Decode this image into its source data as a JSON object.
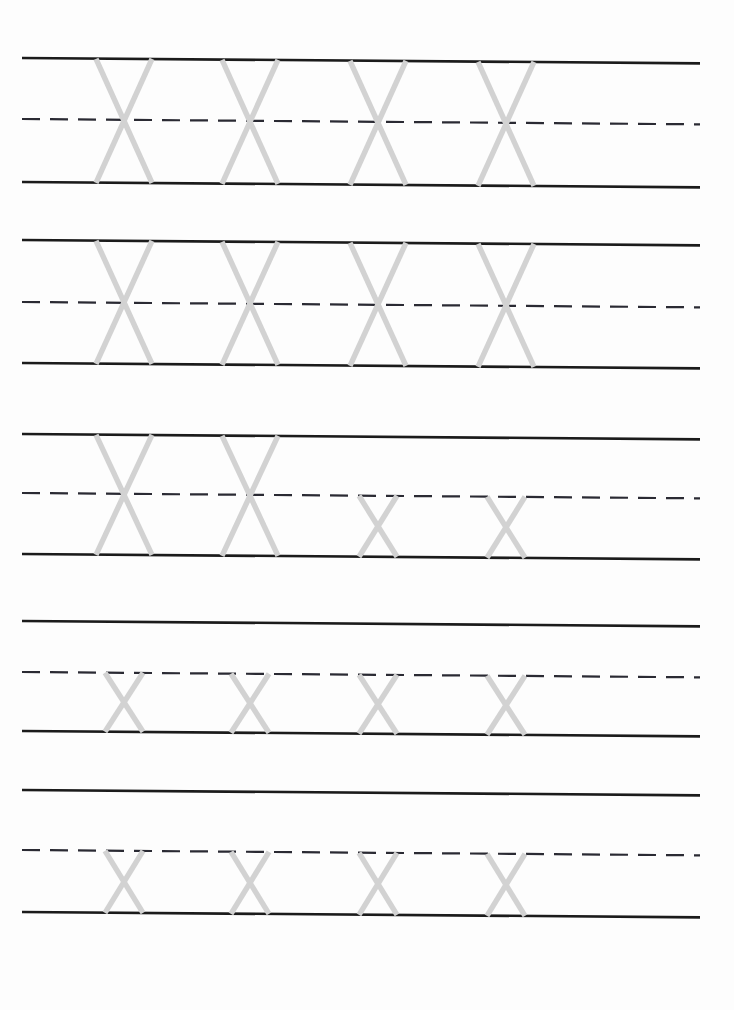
{
  "document": {
    "kind": "handwriting-practice-worksheet",
    "title": "Letter X Tracing Worksheet",
    "page_width": 734,
    "page_height": 1010,
    "background_color": "#ffffff",
    "scan_tilt_degrees": 0.45
  },
  "style": {
    "solid_rule_color": "#1b1b1b",
    "dashed_rule_color": "#2a2a33",
    "trace_letter_color": "#d2d2d2",
    "solid_rule_width": 2.6,
    "dashed_rule_width": 2.2,
    "trace_stroke_width": 5.4,
    "dash_pattern": "18 10",
    "rule_left_x": 22,
    "rule_right_x": 700,
    "letter_centers_x": [
      124,
      250,
      378,
      506
    ],
    "uppercase_letter_width": 56,
    "lowercase_letter_width": 38
  },
  "rows": [
    {
      "index": 1,
      "name": "practice-row-1",
      "top_line_y": 58,
      "midline_y": 119,
      "baseline_y": 182,
      "has_top_line": true,
      "has_midline": true,
      "has_baseline": true,
      "letters": [
        {
          "glyph": "X",
          "case": "uppercase",
          "center_x": 124
        },
        {
          "glyph": "X",
          "case": "uppercase",
          "center_x": 250
        },
        {
          "glyph": "X",
          "case": "uppercase",
          "center_x": 378
        },
        {
          "glyph": "X",
          "case": "uppercase",
          "center_x": 506
        }
      ]
    },
    {
      "index": 2,
      "name": "practice-row-2",
      "top_line_y": 240,
      "midline_y": 302,
      "baseline_y": 363,
      "has_top_line": true,
      "has_midline": true,
      "has_baseline": true,
      "letters": [
        {
          "glyph": "X",
          "case": "uppercase",
          "center_x": 124
        },
        {
          "glyph": "X",
          "case": "uppercase",
          "center_x": 250
        },
        {
          "glyph": "X",
          "case": "uppercase",
          "center_x": 378
        },
        {
          "glyph": "X",
          "case": "uppercase",
          "center_x": 506
        }
      ]
    },
    {
      "index": 3,
      "name": "practice-row-3",
      "top_line_y": 434,
      "midline_y": 493,
      "baseline_y": 554,
      "has_top_line": true,
      "has_midline": true,
      "has_baseline": true,
      "letters": [
        {
          "glyph": "X",
          "case": "uppercase",
          "center_x": 124
        },
        {
          "glyph": "X",
          "case": "uppercase",
          "center_x": 250
        },
        {
          "glyph": "x",
          "case": "lowercase",
          "center_x": 378
        },
        {
          "glyph": "x",
          "case": "lowercase",
          "center_x": 506
        }
      ]
    },
    {
      "index": 4,
      "name": "practice-row-4",
      "top_line_y": 621,
      "midline_y": 672,
      "baseline_y": 731,
      "has_top_line": true,
      "has_midline": true,
      "has_baseline": true,
      "letters": [
        {
          "glyph": "x",
          "case": "lowercase",
          "center_x": 124
        },
        {
          "glyph": "x",
          "case": "lowercase",
          "center_x": 250
        },
        {
          "glyph": "x",
          "case": "lowercase",
          "center_x": 378
        },
        {
          "glyph": "x",
          "case": "lowercase",
          "center_x": 506
        }
      ]
    },
    {
      "index": 5,
      "name": "practice-row-5",
      "top_line_y": 790,
      "midline_y": 850,
      "baseline_y": 912,
      "has_top_line": true,
      "has_midline": true,
      "has_baseline": true,
      "letters": [
        {
          "glyph": "x",
          "case": "lowercase",
          "center_x": 124
        },
        {
          "glyph": "x",
          "case": "lowercase",
          "center_x": 250
        },
        {
          "glyph": "x",
          "case": "lowercase",
          "center_x": 378
        },
        {
          "glyph": "x",
          "case": "lowercase",
          "center_x": 506
        }
      ]
    }
  ]
}
